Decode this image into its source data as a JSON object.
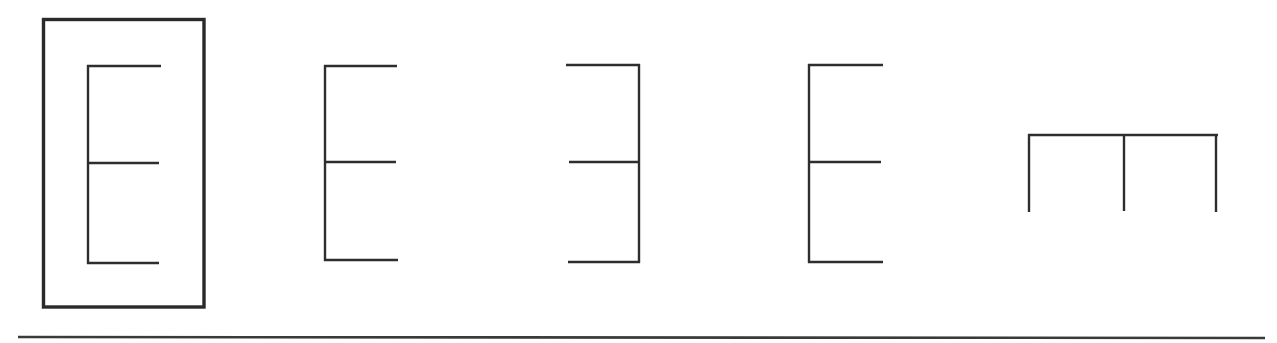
{
  "diagram": {
    "stroke_color": "#2e2e2e",
    "background_color": "#ffffff",
    "figures": [
      {
        "id": "target",
        "role": "target",
        "shape": "E-shape",
        "orientation": "upright, bars pointing right",
        "selected": true,
        "box": {
          "x": 43,
          "y": 19,
          "w": 161,
          "h": 288
        },
        "spine": {
          "x": 88,
          "y1": 66,
          "y2": 263
        },
        "bars": [
          {
            "y": 66,
            "x1": 88,
            "x2": 161
          },
          {
            "y": 163,
            "x1": 88,
            "x2": 159
          },
          {
            "y": 263,
            "x1": 88,
            "x2": 159
          }
        ]
      },
      {
        "id": "option-1",
        "role": "option",
        "shape": "E-shape",
        "orientation": "upright, bars pointing right",
        "spine": {
          "x": 325,
          "y1": 66,
          "y2": 260
        },
        "bars": [
          {
            "y": 66,
            "x1": 325,
            "x2": 397
          },
          {
            "y": 162,
            "x1": 325,
            "x2": 396
          },
          {
            "y": 260,
            "x1": 325,
            "x2": 398
          }
        ]
      },
      {
        "id": "option-2",
        "role": "option",
        "shape": "mirrored E-shape",
        "orientation": "mirrored, bars pointing left",
        "spine": {
          "x": 639,
          "y1": 65,
          "y2": 262
        },
        "bars": [
          {
            "y": 65,
            "x1": 566,
            "x2": 639
          },
          {
            "y": 162,
            "x1": 569,
            "x2": 639
          },
          {
            "y": 262,
            "x1": 568,
            "x2": 639
          }
        ]
      },
      {
        "id": "option-3",
        "role": "option",
        "shape": "E-shape",
        "orientation": "upright, bars pointing right",
        "spine": {
          "x": 809,
          "y1": 65,
          "y2": 262
        },
        "bars": [
          {
            "y": 65,
            "x1": 809,
            "x2": 883
          },
          {
            "y": 162,
            "x1": 809,
            "x2": 881
          },
          {
            "y": 262,
            "x1": 809,
            "x2": 883
          }
        ]
      },
      {
        "id": "option-4",
        "role": "option",
        "shape": "rotated E-shape",
        "orientation": "rotated 90°, bars pointing down",
        "spine": {
          "y": 135,
          "x1": 1029,
          "x2": 1217
        },
        "bars": [
          {
            "x": 1029,
            "y1": 135,
            "y2": 212
          },
          {
            "x": 1124,
            "y1": 135,
            "y2": 211
          },
          {
            "x": 1216,
            "y1": 135,
            "y2": 212
          }
        ]
      }
    ],
    "baseline": {
      "y": 337,
      "x1": 18,
      "x2": 1265
    }
  }
}
